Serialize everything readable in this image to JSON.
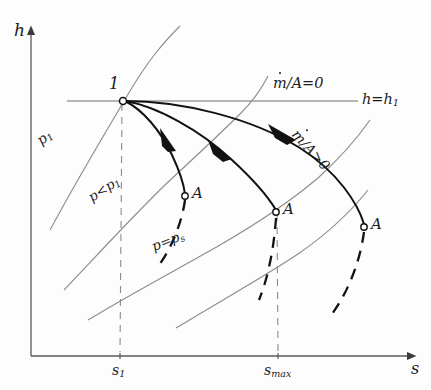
{
  "figure": {
    "type": "h-s-diagram",
    "background_color": "#fdfdfd",
    "ink_color": "#1c1c1c",
    "light_ink_color": "#6b6b6b"
  },
  "axes": {
    "y_label": "h",
    "x_label": "s",
    "origin_px": {
      "x": 31,
      "y": 356
    },
    "x_axis_end_px": {
      "x": 420,
      "y": 356
    },
    "y_axis_top_px": {
      "x": 31,
      "y": 26
    },
    "ticks": [
      {
        "name": "s1",
        "base": "s",
        "subscript": "1",
        "x_px": 119
      },
      {
        "name": "smax",
        "base": "s",
        "subscript": "max",
        "x_px": 278
      }
    ]
  },
  "labels": {
    "h_axis": "h",
    "s_axis": "s",
    "point_1": "1",
    "s_1_base": "s",
    "s_1_sub": "1",
    "s_max_base": "s",
    "s_max_sub": "max",
    "isobar_p1_base": "p",
    "isobar_p1_sub": "1",
    "isobar_p_lt_p1": "p<p",
    "isobar_p_lt_p1_sub": "1",
    "isobar_p_eq_ps": "p=p",
    "isobar_p_eq_ps_sub": "s",
    "enthalpy_line": "h=h",
    "enthalpy_line_sub": "1",
    "mdot_zero_prefix": "m",
    "mdot_zero_suffix": "/A=0",
    "mdot_pos_prefix": "m",
    "mdot_pos_suffix": "/A>0",
    "endpoint_A_1": "A",
    "endpoint_A_2": "A",
    "endpoint_A_3": "A"
  },
  "points": {
    "state_1": {
      "label": "1",
      "x_px": 123,
      "y_px": 101
    },
    "state_A_left": {
      "label": "A",
      "x_px": 185,
      "y_px": 196
    },
    "state_A_middle": {
      "label": "A",
      "x_px": 276,
      "y_px": 212
    },
    "state_A_right": {
      "label": "A",
      "x_px": 364,
      "y_px": 227
    }
  },
  "curves": {
    "solid_bold_paths": 3,
    "dashed_bold_paths": 3,
    "thin_isobars": 4,
    "dashed_guides": 2,
    "horizontal_enthalpy_line": 1
  }
}
